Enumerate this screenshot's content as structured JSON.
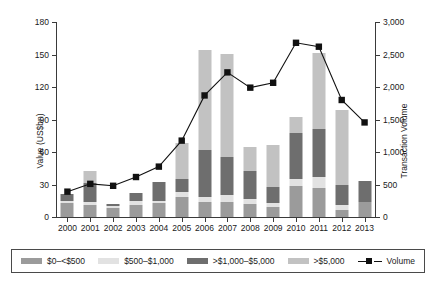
{
  "chart_data": {
    "type": "bar",
    "title": "",
    "subtitle": "",
    "xlabel": "",
    "ylabel": "Value (US$bn)",
    "y2label": "Transaction Volume",
    "grid": false,
    "legend_position": "bottom",
    "categories": [
      "2000",
      "2001",
      "2002",
      "2003",
      "2004",
      "2005",
      "2006",
      "2007",
      "2008",
      "2009",
      "2010",
      "2011",
      "2012",
      "2013"
    ],
    "ylim": [
      0,
      180
    ],
    "yticks": [
      "0",
      "30",
      "60",
      "90",
      "120",
      "150",
      "180"
    ],
    "y2lim": [
      0,
      3000
    ],
    "y2ticks": [
      "0",
      "500",
      "1,000",
      "1,500",
      "2,000",
      "2,500",
      "3,000"
    ],
    "series": [
      {
        "name": "$0–<$500",
        "axis": "left",
        "color": "#9b9b9b",
        "values": [
          12.5,
          11.0,
          8.5,
          11.5,
          12.5,
          18.5,
          14.0,
          13.5,
          12.0,
          9.5,
          28.5,
          27.0,
          6.5,
          14.0
        ]
      },
      {
        "name": "$500–$1,000",
        "axis": "left",
        "color": "#e2e2e2",
        "values": [
          2.0,
          2.5,
          1.5,
          3.5,
          2.5,
          5.0,
          4.5,
          7.0,
          4.5,
          3.5,
          7.0,
          9.5,
          5.0,
          0.0
        ]
      },
      {
        "name": ">$1,000–$5,000",
        "axis": "left",
        "color": "#6e6e6e",
        "values": [
          7.0,
          17.5,
          2.0,
          7.5,
          17.0,
          12.0,
          43.5,
          35.0,
          26.0,
          14.5,
          42.5,
          45.0,
          18.0,
          19.0
        ]
      },
      {
        "name": ">$5,000",
        "axis": "left",
        "color": "#c2c2c2",
        "values": [
          0.0,
          11.5,
          0.0,
          0.0,
          0.0,
          32.5,
          92.0,
          95.0,
          22.5,
          39.0,
          14.0,
          70.0,
          69.0,
          0.0
        ]
      },
      {
        "name": "Volume",
        "axis": "right",
        "color": "#111111",
        "type": "line",
        "values": [
          390,
          510,
          480,
          615,
          775,
          1175,
          1870,
          2225,
          1990,
          2065,
          2680,
          2620,
          1800,
          1455
        ]
      }
    ]
  },
  "axes": {
    "left": {
      "title": "Value (US$bn)",
      "ticks": [
        "180",
        "150",
        "120",
        "90",
        "60",
        "30",
        "0"
      ]
    },
    "right": {
      "title": "Transaction Volume",
      "ticks": [
        "3,000",
        "2,500",
        "2,000",
        "1,500",
        "1,000",
        "500",
        "0"
      ]
    },
    "x": {
      "ticks": [
        "2000",
        "2001",
        "2002",
        "2003",
        "2004",
        "2005",
        "2006",
        "2007",
        "2008",
        "2009",
        "2010",
        "2011",
        "2012",
        "2013"
      ]
    }
  },
  "legend": {
    "items": [
      {
        "label": "$0–<$500",
        "swatch_color": "#9b9b9b",
        "marker": "swatch"
      },
      {
        "label": "$500–$1,000",
        "swatch_color": "#e2e2e2",
        "marker": "swatch"
      },
      {
        "label": ">$1,000–$5,000",
        "swatch_color": "#6e6e6e",
        "marker": "swatch"
      },
      {
        "label": ">$5,000",
        "swatch_color": "#c2c2c2",
        "marker": "swatch"
      },
      {
        "label": "Volume",
        "swatch_color": "#111111",
        "marker": "line-square"
      }
    ]
  }
}
